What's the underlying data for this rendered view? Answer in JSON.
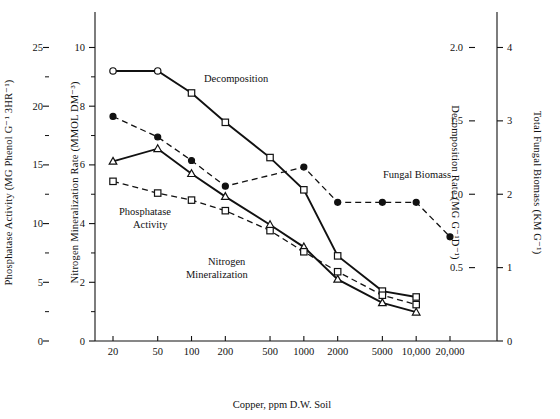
{
  "chart_data": {
    "type": "line",
    "title": "",
    "xlabel": "Copper, ppm D.W. Soil",
    "xscale": "log",
    "xticks": [
      20,
      50,
      100,
      200,
      500,
      1000,
      2000,
      5000,
      10000,
      20000
    ],
    "xticklabels": [
      "20",
      "50",
      "100",
      "200",
      "500",
      "1000",
      "2000",
      "5000",
      "10,000",
      "20,000"
    ],
    "xlim": [
      15,
      26000
    ],
    "grid": false,
    "legend_position": "inline-annotations",
    "axes": [
      {
        "id": "phosphatase",
        "side": "left",
        "position": 1,
        "label": "Phosphatase Activity (MG Phenol  G⁻¹ 3HR⁻¹)",
        "ticks": [
          0,
          5,
          10,
          15,
          20,
          25
        ],
        "ticklabels": [
          "0",
          "5",
          "10",
          "15",
          "20",
          "25"
        ],
        "minor_ticks": [
          2.5,
          7.5,
          12.5,
          17.5,
          22.5
        ],
        "lim": [
          0,
          27
        ]
      },
      {
        "id": "nitrogen",
        "side": "left",
        "position": 2,
        "label": "Nitrogen Mineralization Rate (MMOL DM⁻³)",
        "ticks": [
          0,
          2,
          4,
          6,
          8,
          10
        ],
        "ticklabels": [
          "0",
          "2",
          "4",
          "6",
          "8",
          "10"
        ],
        "minor_ticks": [
          1,
          3,
          5,
          7,
          9
        ],
        "lim": [
          0,
          10.8
        ]
      },
      {
        "id": "decomposition",
        "side": "right",
        "position": 1,
        "label": "Decomposition Rate (MG G⁻¹D⁻¹)",
        "ticks": [
          0.5,
          1.0,
          1.5,
          2.0
        ],
        "ticklabels": [
          "0.5",
          "1.0",
          "1.5",
          "2.0"
        ],
        "minor_ticks": [],
        "lim": [
          0,
          2.16
        ]
      },
      {
        "id": "fungal",
        "side": "right",
        "position": 2,
        "label": "Total Fungal Biomass (KM G⁻¹)",
        "ticks": [
          0,
          1,
          2,
          3,
          4
        ],
        "ticklabels": [
          "0",
          "1",
          "2",
          "3",
          "4"
        ],
        "minor_ticks": [],
        "lim": [
          0,
          4.32
        ]
      }
    ],
    "series": [
      {
        "name": "Decomposition",
        "axis": "decomposition",
        "marker": "open-circle-then-open-square",
        "line": "solid",
        "annotation": "Decomposition",
        "x": [
          20,
          50,
          100,
          200,
          500,
          1000,
          2000,
          5000,
          10000
        ],
        "values": [
          1.84,
          1.84,
          1.69,
          1.49,
          1.25,
          1.03,
          0.58,
          0.34,
          0.3
        ]
      },
      {
        "name": "Fungal Biomass",
        "axis": "fungal",
        "marker": "filled-circle",
        "line": "dashed",
        "annotation": "Fungal Biomass",
        "x": [
          20,
          50,
          100,
          200,
          1000,
          2000,
          5000,
          10000,
          20000
        ],
        "values": [
          3.06,
          2.78,
          2.46,
          2.11,
          2.37,
          1.89,
          1.89,
          1.89,
          1.42
        ]
      },
      {
        "name": "Nitrogen Mineralization",
        "axis": "nitrogen",
        "marker": "open-triangle",
        "line": "solid",
        "annotation": "Nitrogen\nMineralization",
        "x": [
          20,
          50,
          100,
          200,
          500,
          1000,
          2000,
          5000,
          10000
        ],
        "values": [
          6.12,
          6.55,
          5.7,
          4.92,
          3.96,
          3.2,
          2.1,
          1.3,
          0.98
        ]
      },
      {
        "name": "Phosphatase Activity",
        "axis": "phosphatase",
        "marker": "open-square",
        "line": "dashed",
        "annotation": "Phosphatase\nActivity",
        "x": [
          20,
          50,
          100,
          200,
          500,
          1000,
          2000,
          5000,
          10000
        ],
        "values": [
          13.6,
          12.6,
          12.0,
          11.1,
          9.4,
          7.6,
          5.9,
          3.9,
          3.1
        ]
      }
    ],
    "annotations": [
      {
        "id": "ann-decomposition",
        "text": "Decomposition",
        "x": 204,
        "y": 82
      },
      {
        "id": "ann-fungal",
        "text": "Fungal Biomass",
        "x": 383,
        "y": 178
      },
      {
        "id": "ann-phosphatase-1",
        "text": "Phosphatase",
        "x": 119,
        "y": 215
      },
      {
        "id": "ann-phosphatase-2",
        "text": "Activity",
        "x": 133,
        "y": 228
      },
      {
        "id": "ann-nitrogen-1",
        "text": "Nitrogen",
        "x": 208,
        "y": 265
      },
      {
        "id": "ann-nitrogen-2",
        "text": "Mineralization",
        "x": 186,
        "y": 278
      }
    ]
  }
}
